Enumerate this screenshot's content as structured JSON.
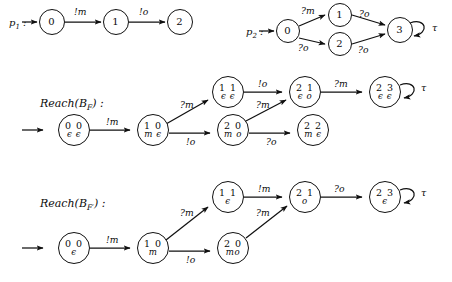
{
  "figure": {
    "title_p1": "p₁ :",
    "title_p2": "p₂ :",
    "row_label_bf": "Reach(B",
    "row_label_bf_sub": "F",
    "row_label_bf_close": ") :",
    "row_label_bfp": "Reach(B",
    "row_label_bfp_sub": "F′",
    "row_label_bfp_close": ") :"
  },
  "p1": {
    "label": "p",
    "label_sub": "1",
    "label_colon": " :",
    "nodes": [
      {
        "id": "p1-0",
        "line1": "0",
        "x": 52,
        "y": 22,
        "r": 13
      },
      {
        "id": "p1-1",
        "line1": "1",
        "x": 116,
        "y": 22,
        "r": 13
      },
      {
        "id": "p1-2",
        "line1": "2",
        "x": 180,
        "y": 22,
        "r": 13
      }
    ],
    "edges": [
      {
        "from": "p1-0",
        "to": "p1-1",
        "label": "!m",
        "lx": 74,
        "ly": 10
      },
      {
        "from": "p1-1",
        "to": "p1-2",
        "label": "!o",
        "lx": 140,
        "ly": 10
      }
    ]
  },
  "p2": {
    "label": "p",
    "label_sub": "2",
    "label_colon": " :",
    "nodes": [
      {
        "id": "p2-0",
        "line1": "0",
        "x": 288,
        "y": 31,
        "r": 12
      },
      {
        "id": "p2-1",
        "line1": "1",
        "x": 340,
        "y": 13,
        "r": 12
      },
      {
        "id": "p2-2",
        "line1": "2",
        "x": 340,
        "y": 44,
        "r": 12
      },
      {
        "id": "p2-3",
        "line1": "3",
        "x": 400,
        "y": 30,
        "r": 13
      }
    ],
    "edges": [
      {
        "label": "?m",
        "lx": 304,
        "ly": 3
      },
      {
        "label": "?o",
        "lx": 366,
        "ly": 3
      },
      {
        "label": "?o",
        "lx": 300,
        "ly": 46
      },
      {
        "label": "?o",
        "lx": 366,
        "ly": 46
      }
    ],
    "self_loop_label": "τ",
    "self_loop_lx": 434,
    "self_loop_ly": 24
  },
  "reach_bf": {
    "label_text": "Reach(B",
    "label_sub": "F",
    "label_close": ") :",
    "label_x": 40,
    "label_y": 97,
    "nodes": [
      {
        "id": "bf-00",
        "line1": "0 0",
        "line2": "ϵ ϵ",
        "x": 74,
        "y": 130,
        "r": 16
      },
      {
        "id": "bf-10",
        "line1": "1 0",
        "line2": "m ϵ",
        "x": 153,
        "y": 130,
        "r": 16
      },
      {
        "id": "bf-11",
        "line1": "1 1",
        "line2": "ϵ ϵ",
        "x": 228,
        "y": 92,
        "r": 16
      },
      {
        "id": "bf-20",
        "line1": "2 0",
        "line2": "m o",
        "x": 233,
        "y": 130,
        "r": 16
      },
      {
        "id": "bf-21",
        "line1": "2 1",
        "line2": "ϵ o",
        "x": 305,
        "y": 92,
        "r": 16
      },
      {
        "id": "bf-22",
        "line1": "2 2",
        "line2": "m ϵ",
        "x": 313,
        "y": 130,
        "r": 16
      },
      {
        "id": "bf-23",
        "line1": "2 3",
        "line2": "ϵ ϵ",
        "x": 385,
        "y": 92,
        "r": 16
      }
    ],
    "edges": [
      {
        "label": "!m",
        "lx": 107,
        "ly": 119
      },
      {
        "label": "?m",
        "lx": 188,
        "ly": 100
      },
      {
        "label": "!o",
        "lx": 194,
        "ly": 139
      },
      {
        "label": "?m",
        "lx": 264,
        "ly": 100
      },
      {
        "label": "?o",
        "lx": 274,
        "ly": 139
      },
      {
        "label": "!o",
        "lx": 262,
        "ly": 81
      },
      {
        "label": "?m",
        "lx": 340,
        "ly": 81
      }
    ],
    "self_loop_label": "τ",
    "self_loop_lx": 421,
    "self_loop_ly": 85
  },
  "reach_bfp": {
    "label_text": "Reach(B",
    "label_sub": "F′",
    "label_close": ") :",
    "label_x": 40,
    "label_y": 197,
    "nodes": [
      {
        "id": "bfp-00",
        "line1": "0 0",
        "line2": "ϵ",
        "x": 74,
        "y": 248,
        "r": 16
      },
      {
        "id": "bfp-10",
        "line1": "1 0",
        "line2": "m",
        "x": 153,
        "y": 248,
        "r": 16
      },
      {
        "id": "bfp-11",
        "line1": "1 1",
        "line2": "ϵ",
        "x": 228,
        "y": 197,
        "r": 16
      },
      {
        "id": "bfp-20",
        "line1": "2 0",
        "line2": "mo",
        "x": 233,
        "y": 248,
        "r": 16
      },
      {
        "id": "bfp-21",
        "line1": "2 1",
        "line2": "o",
        "x": 305,
        "y": 197,
        "r": 16
      },
      {
        "id": "bfp-23",
        "line1": "2 3",
        "line2": "ϵ",
        "x": 385,
        "y": 197,
        "r": 16
      }
    ],
    "edges": [
      {
        "label": "!m",
        "lx": 107,
        "ly": 237
      },
      {
        "label": "?m",
        "lx": 188,
        "ly": 208
      },
      {
        "label": "!o",
        "lx": 194,
        "ly": 257
      },
      {
        "label": "?m",
        "lx": 264,
        "ly": 208
      },
      {
        "label": "!m",
        "lx": 262,
        "ly": 186
      },
      {
        "label": "?o",
        "lx": 340,
        "ly": 186
      }
    ],
    "self_loop_label": "τ",
    "self_loop_lx": 421,
    "self_loop_ly": 190
  },
  "colors": {
    "ink": "#101010",
    "paper": "#ffffff"
  }
}
